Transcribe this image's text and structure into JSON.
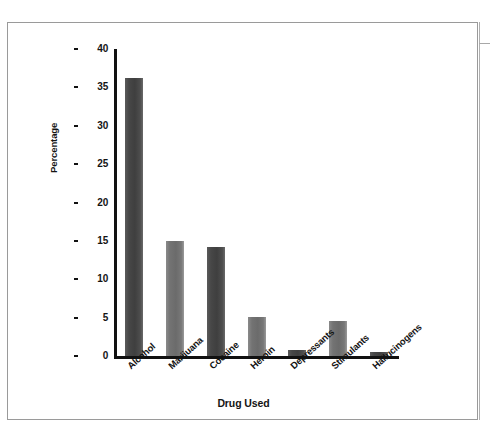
{
  "chart_data": {
    "type": "bar",
    "title": "",
    "xlabel": "Drug Used",
    "ylabel": "Percentage",
    "categories": [
      "Alcohol",
      "Marijuana",
      "Cocaine",
      "Heroin",
      "Depressants",
      "Stimulants",
      "Hallucinogens"
    ],
    "values": [
      36.2,
      15.0,
      14.2,
      5.1,
      0.8,
      4.5,
      0.5
    ],
    "ylim": [
      0,
      40
    ],
    "ytick_step": 5,
    "yticks": [
      "0",
      "5",
      "10",
      "15",
      "20",
      "25",
      "30",
      "35",
      "40"
    ],
    "grid": false,
    "legend": false,
    "bar_colors": [
      "#474747",
      "#737373",
      "#474747",
      "#737373",
      "#474747",
      "#737373",
      "#474747"
    ],
    "axis_color": "#111111",
    "frame_color": "#9a9a9a",
    "background": "#ffffff"
  }
}
